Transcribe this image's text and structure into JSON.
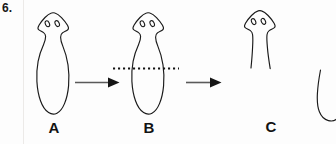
{
  "figure": {
    "number_label": "6.",
    "background_color": "#fdfdfd",
    "ink_color": "#1a1a1a",
    "arrow_color": "#4d4d4d"
  },
  "stages": [
    {
      "id": "A",
      "label": "A",
      "description": "intact planarian with triangular head, two eyespots and elongated body",
      "eyespot_count": 2,
      "cut_line": false
    },
    {
      "id": "B",
      "label": "B",
      "description": "intact planarian with horizontal dotted cut line across mid-body",
      "eyespot_count": 2,
      "cut_line": true
    },
    {
      "id": "C",
      "label": "C",
      "description": "anterior head fragment after transverse cut, body severed open",
      "eyespot_count": 2,
      "cut_line": false
    },
    {
      "id": "D",
      "label": "",
      "description": "partially cropped fourth figure at right edge",
      "eyespot_count": 0,
      "cut_line": false
    }
  ],
  "arrows": [
    {
      "name": "arrow-a-to-b",
      "from": "A",
      "to": "B",
      "direction": "right"
    },
    {
      "name": "arrow-b-to-c",
      "from": "B",
      "to": "C",
      "direction": "right"
    }
  ],
  "cut_line": {
    "name": "dotted-cut-line",
    "style": "dotted",
    "orientation": "horizontal",
    "applies_to_stage": "B"
  }
}
